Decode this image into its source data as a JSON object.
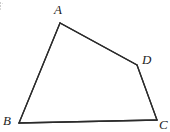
{
  "figure": {
    "kind": "geometry-diagram",
    "shape_name": "quadrilateral",
    "canvas": {
      "width": 170,
      "height": 132
    },
    "background_color": "#ffffff",
    "stroke_color": "#2b2b2b",
    "stroke_width": 1.3,
    "label_color": "#1d1d1d",
    "vertices": [
      {
        "id": "A",
        "label": "A",
        "x": 60,
        "y": 23,
        "label_x": 59,
        "label_y": 10
      },
      {
        "id": "B",
        "label": "B",
        "x": 19,
        "y": 123,
        "label_x": 9,
        "label_y": 121
      },
      {
        "id": "C",
        "label": "C",
        "x": 157,
        "y": 120,
        "label_x": 164,
        "label_y": 125
      },
      {
        "id": "D",
        "label": "D",
        "x": 137,
        "y": 65,
        "label_x": 147,
        "label_y": 60
      }
    ],
    "edges": [
      {
        "id": "AB",
        "from": "A",
        "to": "B"
      },
      {
        "id": "BC",
        "from": "B",
        "to": "C"
      },
      {
        "id": "CD",
        "from": "C",
        "to": "D"
      },
      {
        "id": "DA",
        "from": "D",
        "to": "A"
      }
    ],
    "path_points": "60,23 19,123 157,120 137,65",
    "artifact": {
      "present": true,
      "x": 0,
      "y": 2,
      "width": 3,
      "height": 9,
      "color": "#9a9a9a"
    }
  },
  "labels": {
    "A": "A",
    "B": "B",
    "C": "C",
    "D": "D"
  }
}
